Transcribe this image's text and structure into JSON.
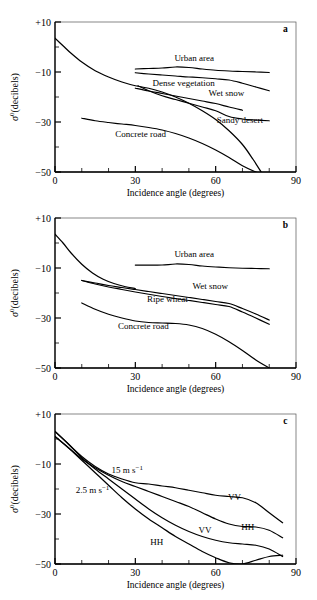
{
  "figure": {
    "panel_count": 3,
    "line_color": "#000000",
    "background": "#ffffff"
  },
  "axes": {
    "xlabel": "Incidence angle (degrees)",
    "ylabel_sigma": "σ",
    "ylabel_sup": "0",
    "ylabel_unit": "(decibels)",
    "xticks": [
      "0",
      "30",
      "60",
      "90"
    ],
    "yticks": [
      "+10",
      "−10",
      "−30",
      "−50"
    ],
    "xlim": [
      0,
      90
    ],
    "ylim": [
      -50,
      10
    ],
    "xminor_step": 10,
    "yminor_step": 10,
    "grid": false
  },
  "panels": [
    {
      "id": "a",
      "letter": "a"
    },
    {
      "id": "b",
      "letter": "b"
    },
    {
      "id": "c",
      "letter": "c"
    }
  ],
  "chart_data": [
    {
      "type": "line",
      "panel": "a",
      "title": "",
      "xlabel": "Incidence angle (degrees)",
      "ylabel": "σ⁰ (decibels)",
      "xlim": [
        0,
        90
      ],
      "ylim": [
        -50,
        10
      ],
      "grid": false,
      "legend_position": "inline-labels",
      "annotations": [
        {
          "text": "a",
          "x": 86,
          "y": 6
        },
        {
          "text": "Urban area",
          "x": 52,
          "y": -5.5
        },
        {
          "text": "Dense vegetation",
          "x": 48,
          "y": -15.5
        },
        {
          "text": "Wet snow",
          "x": 64,
          "y": -19.5
        },
        {
          "text": "Sandy desert",
          "x": 69,
          "y": -30.5
        },
        {
          "text": "Concrete road",
          "x": 32,
          "y": -36
        }
      ],
      "series": [
        {
          "name": "Smooth water / specular (unlabelled steep curve)",
          "x": [
            0,
            3,
            6,
            10,
            15,
            20,
            25,
            30,
            35,
            40,
            45,
            50,
            55,
            60,
            65,
            70,
            74,
            77
          ],
          "values": [
            3.5,
            0.5,
            -2.5,
            -6.0,
            -9.5,
            -12.0,
            -14.0,
            -15.5,
            -16.5,
            -18.0,
            -20.0,
            -22.5,
            -25.5,
            -29.0,
            -33.5,
            -39.0,
            -45.0,
            -50.0
          ]
        },
        {
          "name": "Urban area",
          "x": [
            30,
            35,
            40,
            45,
            50,
            55,
            60,
            65,
            70,
            75,
            80
          ],
          "values": [
            -8.8,
            -8.6,
            -8.4,
            -8.0,
            -8.2,
            -8.8,
            -9.3,
            -9.6,
            -9.8,
            -10.0,
            -10.2
          ]
        },
        {
          "name": "Dense vegetation",
          "x": [
            30,
            35,
            40,
            45,
            50,
            55,
            60,
            65,
            70,
            75,
            80
          ],
          "values": [
            -10.3,
            -10.8,
            -11.2,
            -11.6,
            -12.0,
            -12.3,
            -12.7,
            -13.2,
            -14.5,
            -16.0,
            -17.5
          ]
        },
        {
          "name": "Wet snow",
          "x": [
            30,
            35,
            40,
            45,
            50,
            55,
            60,
            65,
            70
          ],
          "values": [
            -16.5,
            -17.6,
            -18.6,
            -19.6,
            -20.6,
            -21.6,
            -22.6,
            -24.0,
            -25.3
          ]
        },
        {
          "name": "Sandy desert",
          "x": [
            31,
            35,
            40,
            45,
            50,
            55,
            60,
            65,
            70,
            75,
            80
          ],
          "values": [
            -15.5,
            -17.5,
            -19.5,
            -21.0,
            -22.5,
            -24.0,
            -25.5,
            -27.8,
            -28.8,
            -29.2,
            -29.5
          ]
        },
        {
          "name": "Concrete road",
          "x": [
            10,
            15,
            20,
            25,
            30,
            35,
            40,
            45,
            50,
            55,
            60,
            65,
            70,
            75,
            79
          ],
          "values": [
            -28.5,
            -29.5,
            -30.2,
            -30.8,
            -31.4,
            -32.2,
            -33.2,
            -34.6,
            -36.4,
            -38.6,
            -41.2,
            -44.2,
            -47.5,
            -50.0,
            -52.0
          ]
        }
      ]
    },
    {
      "type": "line",
      "panel": "b",
      "title": "",
      "xlabel": "Incidence angle (degrees)",
      "ylabel": "σ⁰ (decibels)",
      "xlim": [
        0,
        90
      ],
      "ylim": [
        -50,
        10
      ],
      "grid": false,
      "legend_position": "inline-labels",
      "annotations": [
        {
          "text": "b",
          "x": 86,
          "y": 6
        },
        {
          "text": "Urban area",
          "x": 52,
          "y": -5.5
        },
        {
          "text": "Wet snow",
          "x": 58,
          "y": -18.5
        },
        {
          "text": "Ripe wheat",
          "x": 42,
          "y": -23.5
        },
        {
          "text": "Concrete road",
          "x": 33,
          "y": -34.5
        }
      ],
      "series": [
        {
          "name": "Smooth water / specular (unlabelled steep curve)",
          "x": [
            0,
            3,
            6,
            10,
            14,
            18,
            22,
            26,
            30
          ],
          "values": [
            3.5,
            0.0,
            -4.0,
            -8.5,
            -12.0,
            -14.5,
            -16.2,
            -17.4,
            -18.2
          ]
        },
        {
          "name": "Urban area",
          "x": [
            30,
            35,
            40,
            45,
            50,
            55,
            60,
            65,
            70,
            75,
            80
          ],
          "values": [
            -8.8,
            -8.8,
            -8.8,
            -8.4,
            -8.6,
            -9.2,
            -9.6,
            -9.9,
            -10.1,
            -10.2,
            -10.3
          ]
        },
        {
          "name": "Wet snow",
          "x": [
            10,
            15,
            20,
            25,
            30,
            35,
            40,
            45,
            50,
            55,
            60,
            65,
            70,
            75,
            80
          ],
          "values": [
            -15.0,
            -16.0,
            -17.0,
            -17.8,
            -18.6,
            -19.4,
            -20.2,
            -21.0,
            -21.8,
            -22.6,
            -23.4,
            -24.2,
            -26.2,
            -28.4,
            -30.8
          ]
        },
        {
          "name": "Ripe wheat",
          "x": [
            10,
            15,
            20,
            25,
            30,
            35,
            40,
            45,
            50,
            55,
            60,
            65,
            70,
            75,
            80
          ],
          "values": [
            -15.0,
            -16.4,
            -17.6,
            -18.6,
            -19.6,
            -20.5,
            -21.4,
            -22.2,
            -23.0,
            -23.8,
            -24.6,
            -25.4,
            -27.6,
            -30.0,
            -32.5
          ]
        },
        {
          "name": "Concrete road",
          "x": [
            10,
            15,
            20,
            25,
            30,
            35,
            40,
            45,
            50,
            55,
            60,
            65,
            70,
            75,
            80
          ],
          "values": [
            -24.0,
            -26.5,
            -28.5,
            -30.0,
            -31.2,
            -31.8,
            -32.0,
            -32.2,
            -32.8,
            -34.2,
            -36.5,
            -39.5,
            -43.0,
            -46.8,
            -50.0
          ]
        }
      ]
    },
    {
      "type": "line",
      "panel": "c",
      "title": "",
      "xlabel": "Incidence angle (degrees)",
      "ylabel": "σ⁰ (decibels)",
      "xlim": [
        0,
        90
      ],
      "ylim": [
        -50,
        10
      ],
      "grid": false,
      "legend_position": "inline-labels",
      "annotations": [
        {
          "text": "c",
          "x": 86,
          "y": 6
        },
        {
          "text": "15 m s⁻¹",
          "x": 27,
          "y": -13.5
        },
        {
          "text": "2.5 m s⁻¹",
          "x": 14,
          "y": -21.5
        },
        {
          "text": "VV",
          "x": 67,
          "y": -24.5,
          "series": "15 m s-1 VV"
        },
        {
          "text": "HH",
          "x": 72,
          "y": -36.5,
          "series": "15 m s-1 HH"
        },
        {
          "text": "VV",
          "x": 56,
          "y": -37.5,
          "series": "2.5 m s-1 VV"
        },
        {
          "text": "HH",
          "x": 38,
          "y": -42.5,
          "series": "2.5 m s-1 HH"
        }
      ],
      "wind_speeds": [
        "15 m s⁻¹",
        "2.5 m s⁻¹"
      ],
      "polarizations": [
        "VV",
        "HH"
      ],
      "series": [
        {
          "name": "15 m s-1 VV",
          "x": [
            0,
            5,
            10,
            15,
            20,
            25,
            30,
            35,
            40,
            45,
            50,
            55,
            60,
            65,
            70,
            75,
            80,
            85
          ],
          "values": [
            3.0,
            -2.0,
            -7.0,
            -11.0,
            -14.0,
            -16.0,
            -17.5,
            -18.0,
            -18.8,
            -19.5,
            -20.5,
            -21.5,
            -22.5,
            -23.0,
            -23.5,
            -25.5,
            -29.5,
            -33.5
          ]
        },
        {
          "name": "15 m s-1 HH",
          "x": [
            0,
            5,
            10,
            15,
            20,
            25,
            30,
            35,
            40,
            45,
            50,
            55,
            60,
            65,
            70,
            75,
            80,
            85
          ],
          "values": [
            1.0,
            -3.5,
            -8.0,
            -11.5,
            -14.5,
            -17.0,
            -19.0,
            -21.0,
            -23.0,
            -25.0,
            -27.0,
            -29.5,
            -32.0,
            -34.0,
            -35.0,
            -35.2,
            -36.5,
            -39.5
          ]
        },
        {
          "name": "2.5 m s-1 VV",
          "x": [
            0,
            5,
            10,
            15,
            20,
            25,
            30,
            35,
            40,
            45,
            50,
            55,
            60,
            65,
            70,
            75,
            80,
            85
          ],
          "values": [
            3.0,
            -2.0,
            -7.5,
            -12.0,
            -16.0,
            -20.0,
            -24.0,
            -28.0,
            -31.5,
            -34.5,
            -37.0,
            -39.0,
            -40.5,
            -41.5,
            -42.0,
            -42.5,
            -44.0,
            -47.0
          ]
        },
        {
          "name": "2.5 m s-1 HH",
          "x": [
            0,
            5,
            10,
            15,
            20,
            25,
            30,
            35,
            40,
            45,
            50,
            55,
            60,
            65,
            70,
            75,
            80,
            85
          ],
          "values": [
            1.0,
            -3.5,
            -8.5,
            -13.5,
            -18.5,
            -23.5,
            -28.0,
            -32.0,
            -35.5,
            -39.0,
            -42.0,
            -45.0,
            -47.5,
            -49.5,
            -50.0,
            -48.5,
            -47.0,
            -46.5
          ]
        }
      ]
    }
  ]
}
